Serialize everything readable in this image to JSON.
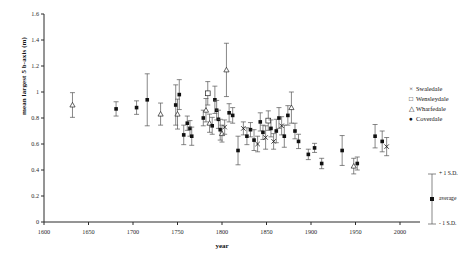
{
  "chart_data": {
    "type": "scatter",
    "title": "",
    "xlabel": "year",
    "ylabel": "mean largest 5 b-axis (m)",
    "xlim": [
      1600,
      2000
    ],
    "ylim": [
      0,
      1.6
    ],
    "xticks": [
      1600,
      1650,
      1700,
      1750,
      1800,
      1850,
      1900,
      1950,
      2000
    ],
    "yticks": [
      0,
      0.2,
      0.4,
      0.6,
      0.8,
      1,
      1.2,
      1.4,
      1.6
    ],
    "grid": false,
    "errorbars": "±1 S.D.",
    "legend_position": "right",
    "legend": [
      {
        "name": "Swaledale",
        "marker": "cross"
      },
      {
        "name": "Wensleydale",
        "marker": "open-square"
      },
      {
        "name": "Wharfedale",
        "marker": "open-triangle"
      },
      {
        "name": "Coverdale",
        "marker": "filled-circle"
      }
    ],
    "sd_legend": {
      "top_label": "+ 1 S.D.",
      "mid_label": "average",
      "bottom_label": "- 1 S.D."
    },
    "points": [
      {
        "x": 1632,
        "y": 0.9,
        "err": 0.095,
        "series": "Wharfedale"
      },
      {
        "x": 1681,
        "y": 0.87,
        "err": 0.055,
        "series": "Coverdale"
      },
      {
        "x": 1704,
        "y": 0.88,
        "err": 0.052,
        "series": "Coverdale"
      },
      {
        "x": 1716,
        "y": 0.94,
        "err": 0.2,
        "series": "Coverdale"
      },
      {
        "x": 1731,
        "y": 0.83,
        "err": 0.085,
        "series": "Wharfedale"
      },
      {
        "x": 1748,
        "y": 0.9,
        "err": 0.155,
        "series": "Coverdale"
      },
      {
        "x": 1750,
        "y": 0.83,
        "err": 0.115,
        "series": "Wharfedale"
      },
      {
        "x": 1752,
        "y": 0.98,
        "err": 0.115,
        "series": "Coverdale"
      },
      {
        "x": 1757,
        "y": 0.67,
        "err": 0.075,
        "series": "Coverdale"
      },
      {
        "x": 1761,
        "y": 0.76,
        "err": 0.055,
        "series": "Coverdale"
      },
      {
        "x": 1764,
        "y": 0.72,
        "err": 0.06,
        "series": "Coverdale"
      },
      {
        "x": 1766,
        "y": 0.66,
        "err": 0.07,
        "series": "Coverdale"
      },
      {
        "x": 1779,
        "y": 0.8,
        "err": 0.06,
        "series": "Coverdale"
      },
      {
        "x": 1782,
        "y": 0.86,
        "err": 0.09,
        "series": "Wharfedale"
      },
      {
        "x": 1784,
        "y": 0.99,
        "err": 0.09,
        "series": "Wensleydale"
      },
      {
        "x": 1786,
        "y": 0.76,
        "err": 0.07,
        "series": "Wharfedale"
      },
      {
        "x": 1789,
        "y": 0.74,
        "err": 0.065,
        "series": "Coverdale"
      },
      {
        "x": 1792,
        "y": 0.94,
        "err": 0.105,
        "series": "Coverdale"
      },
      {
        "x": 1794,
        "y": 0.86,
        "err": 0.075,
        "series": "Coverdale"
      },
      {
        "x": 1796,
        "y": 0.79,
        "err": 0.07,
        "series": "Coverdale"
      },
      {
        "x": 1798,
        "y": 0.71,
        "err": 0.08,
        "series": "Coverdale"
      },
      {
        "x": 1800,
        "y": 0.68,
        "err": 0.065,
        "series": "Wharfedale"
      },
      {
        "x": 1803,
        "y": 0.73,
        "err": 0.055,
        "series": "Swaledale"
      },
      {
        "x": 1805,
        "y": 1.17,
        "err": 0.205,
        "series": "Wharfedale"
      },
      {
        "x": 1808,
        "y": 0.84,
        "err": 0.07,
        "series": "Coverdale"
      },
      {
        "x": 1812,
        "y": 0.82,
        "err": 0.06,
        "series": "Coverdale"
      },
      {
        "x": 1818,
        "y": 0.55,
        "err": 0.11,
        "series": "Coverdale"
      },
      {
        "x": 1824,
        "y": 0.72,
        "err": 0.05,
        "series": "Swaledale"
      },
      {
        "x": 1828,
        "y": 0.66,
        "err": 0.065,
        "series": "Coverdale"
      },
      {
        "x": 1832,
        "y": 0.71,
        "err": 0.055,
        "series": "Coverdale"
      },
      {
        "x": 1836,
        "y": 0.63,
        "err": 0.08,
        "series": "Coverdale"
      },
      {
        "x": 1840,
        "y": 0.6,
        "err": 0.06,
        "series": "Swaledale"
      },
      {
        "x": 1843,
        "y": 0.77,
        "err": 0.07,
        "series": "Coverdale"
      },
      {
        "x": 1846,
        "y": 0.69,
        "err": 0.055,
        "series": "Coverdale"
      },
      {
        "x": 1849,
        "y": 0.65,
        "err": 0.09,
        "series": "Swaledale"
      },
      {
        "x": 1852,
        "y": 0.78,
        "err": 0.075,
        "series": "Wensleydale"
      },
      {
        "x": 1855,
        "y": 0.72,
        "err": 0.065,
        "series": "Coverdale"
      },
      {
        "x": 1858,
        "y": 0.62,
        "err": 0.06,
        "series": "Swaledale"
      },
      {
        "x": 1861,
        "y": 0.7,
        "err": 0.09,
        "series": "Coverdale"
      },
      {
        "x": 1864,
        "y": 0.8,
        "err": 0.08,
        "series": "Coverdale"
      },
      {
        "x": 1867,
        "y": 0.74,
        "err": 0.07,
        "series": "Swaledale"
      },
      {
        "x": 1870,
        "y": 0.66,
        "err": 0.085,
        "series": "Coverdale"
      },
      {
        "x": 1874,
        "y": 0.82,
        "err": 0.075,
        "series": "Coverdale"
      },
      {
        "x": 1878,
        "y": 0.88,
        "err": 0.12,
        "series": "Wharfedale"
      },
      {
        "x": 1882,
        "y": 0.7,
        "err": 0.06,
        "series": "Coverdale"
      },
      {
        "x": 1886,
        "y": 0.62,
        "err": 0.055,
        "series": "Coverdale"
      },
      {
        "x": 1897,
        "y": 0.52,
        "err": 0.04,
        "series": "Coverdale"
      },
      {
        "x": 1904,
        "y": 0.57,
        "err": 0.035,
        "series": "Coverdale"
      },
      {
        "x": 1912,
        "y": 0.45,
        "err": 0.04,
        "series": "Coverdale"
      },
      {
        "x": 1935,
        "y": 0.55,
        "err": 0.115,
        "series": "Coverdale"
      },
      {
        "x": 1948,
        "y": 0.43,
        "err": 0.06,
        "series": "Wharfedale"
      },
      {
        "x": 1952,
        "y": 0.45,
        "err": 0.05,
        "series": "Coverdale"
      },
      {
        "x": 1972,
        "y": 0.66,
        "err": 0.09,
        "series": "Coverdale"
      },
      {
        "x": 1980,
        "y": 0.62,
        "err": 0.08,
        "series": "Coverdale"
      },
      {
        "x": 1985,
        "y": 0.58,
        "err": 0.07,
        "series": "Swaledale"
      }
    ]
  }
}
